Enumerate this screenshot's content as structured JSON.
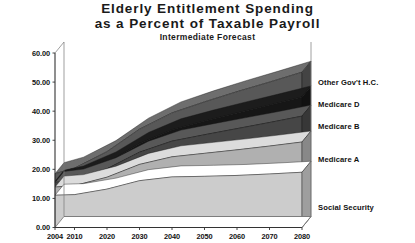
{
  "chart_data": {
    "type": "area",
    "title": "Elderly Entitlement Spending as a Percent of Taxable Payroll",
    "title_line1": "Elderly  Entitlement  Spending",
    "title_line2": "as a Percent of Taxable Payroll",
    "subtitle": "Intermediate Forecast",
    "xlabel": "",
    "ylabel": "",
    "stacked": true,
    "grid": false,
    "legend_position": "right-inline",
    "xlim": [
      2004,
      2080
    ],
    "ylim": [
      0,
      60
    ],
    "yticks": [
      "0.00",
      "10.00",
      "20.00",
      "30.00",
      "40.00",
      "50.00",
      "60.00"
    ],
    "ytick_values": [
      0,
      10,
      20,
      30,
      40,
      50,
      60
    ],
    "xticks": [
      "2004",
      "2010",
      "2020",
      "2030",
      "2040",
      "2050",
      "2060",
      "2070",
      "2080"
    ],
    "xtick_values": [
      2004,
      2010,
      2020,
      2030,
      2040,
      2050,
      2060,
      2070,
      2080
    ],
    "x": [
      2004,
      2010,
      2020,
      2030,
      2040,
      2050,
      2060,
      2070,
      2080
    ],
    "series": [
      {
        "name": "Social Security",
        "color": "#ffffff",
        "values": [
          11.1,
          11.3,
          13.2,
          16.1,
          17.4,
          17.6,
          17.9,
          18.4,
          19.0
        ]
      },
      {
        "name": "Medicare A",
        "color": "#dcdcdc",
        "values": [
          2.8,
          3.1,
          4.1,
          5.6,
          6.9,
          7.9,
          8.8,
          9.6,
          10.4
        ]
      },
      {
        "name": "Medicare B",
        "color": "#585858",
        "values": [
          1.6,
          1.9,
          2.9,
          4.2,
          5.4,
          6.4,
          7.3,
          8.1,
          8.9
        ]
      },
      {
        "name": "Medicare D",
        "color": "#1c1c1c",
        "values": [
          0.4,
          1.1,
          2.0,
          3.0,
          3.9,
          4.7,
          5.4,
          6.0,
          6.6
        ]
      },
      {
        "name": "Other Gov't H.C.",
        "color": "#6e6e6e",
        "values": [
          2.6,
          3.0,
          3.9,
          4.9,
          5.8,
          6.6,
          7.3,
          7.9,
          8.5
        ]
      }
    ],
    "totals": [
      18.5,
      20.4,
      26.1,
      33.8,
      39.4,
      43.2,
      46.7,
      50.0,
      53.4
    ],
    "legend_entries": [
      {
        "label": "Other Gov't H.C."
      },
      {
        "label": "Medicare D"
      },
      {
        "label": "Medicare B"
      },
      {
        "label": "Medicare A"
      },
      {
        "label": "Social Security"
      }
    ]
  }
}
